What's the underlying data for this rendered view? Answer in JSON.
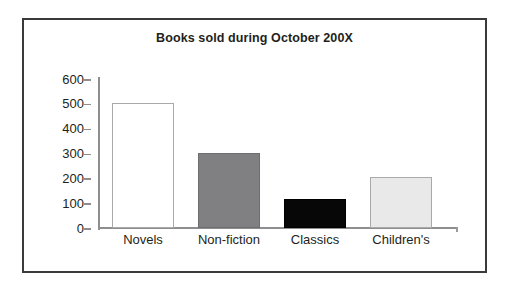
{
  "figure": {
    "frame_color": "#3a3a3c",
    "background": "#ffffff"
  },
  "chart_data": {
    "type": "bar",
    "title": "Books sold during October 200X",
    "xlabel": "",
    "ylabel": "",
    "categories": [
      "Novels",
      "Non-fiction",
      "Classics",
      "Children's"
    ],
    "values": [
      503,
      303,
      115,
      205
    ],
    "ylim": [
      0,
      600
    ],
    "y_ticks": [
      0,
      100,
      200,
      300,
      400,
      500,
      600
    ],
    "y_tick_labels": [
      "0",
      "100",
      "200",
      "300",
      "400",
      "500",
      "600"
    ],
    "grid": false,
    "legend": null,
    "bar_colors": [
      "#ffffff",
      "#808082",
      "#070707",
      "#e9e9e9"
    ],
    "bar_edge_colors": [
      "#a9a9ab",
      "#6e6e70",
      "#000000",
      "#a9a9ab"
    ],
    "axis_color": "#8e8e90",
    "text_color": "#231f20"
  }
}
